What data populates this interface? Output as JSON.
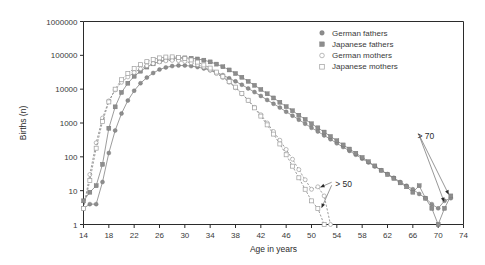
{
  "chart_data": {
    "type": "line",
    "title": "",
    "xlabel": "Age in years",
    "ylabel": "Births (n)",
    "yscale": "log",
    "ylim": [
      1,
      1000000
    ],
    "xlim": [
      14,
      74
    ],
    "xticks": [
      14,
      18,
      22,
      26,
      30,
      34,
      38,
      42,
      46,
      50,
      54,
      58,
      62,
      66,
      70,
      74
    ],
    "xticklabels": [
      "14",
      "18",
      "22",
      "26",
      "30",
      "34",
      "38",
      "42",
      "46",
      "50",
      "54",
      "58",
      "62",
      "66",
      "70",
      "74"
    ],
    "yticks": [
      1,
      10,
      100,
      1000,
      10000,
      100000,
      1000000
    ],
    "yticklabels": [
      "1",
      "10",
      "100",
      "1000",
      "10000",
      "100000",
      "1000000"
    ],
    "grid": false,
    "legend_position": "top-right",
    "annotations": [
      {
        "text": "> 50",
        "x": 53.5,
        "y": 16
      },
      {
        "text": "> 70",
        "x": 66.5,
        "y": 420
      }
    ],
    "series": [
      {
        "name": "German fathers",
        "marker": "filled-circle",
        "linestyle": "solid",
        "color": "#8d8d8d",
        "x": [
          14,
          15,
          16,
          17,
          18,
          19,
          20,
          21,
          22,
          23,
          24,
          25,
          26,
          27,
          28,
          29,
          30,
          31,
          32,
          33,
          34,
          35,
          36,
          37,
          38,
          39,
          40,
          41,
          42,
          43,
          44,
          45,
          46,
          47,
          48,
          49,
          50,
          51,
          52,
          53,
          54,
          55,
          56,
          57,
          58,
          59,
          60,
          61,
          62,
          63,
          64,
          65,
          66,
          67,
          68,
          69,
          70,
          71,
          72
        ],
        "y": [
          3,
          4,
          4,
          18,
          130,
          600,
          1900,
          4600,
          9000,
          15000,
          22000,
          30000,
          38000,
          44000,
          48000,
          50000,
          50000,
          48000,
          45000,
          41000,
          36000,
          31000,
          26000,
          21000,
          17000,
          13500,
          10500,
          8200,
          6300,
          4800,
          3700,
          2850,
          2150,
          1650,
          1250,
          950,
          720,
          560,
          430,
          330,
          250,
          195,
          150,
          115,
          88,
          68,
          52,
          40,
          31,
          24,
          18,
          14,
          11,
          8,
          6,
          4,
          3,
          5,
          6
        ]
      },
      {
        "name": "Japanese fathers",
        "marker": "filled-square",
        "linestyle": "solid",
        "color": "#8d8d8d",
        "x": [
          14,
          15,
          16,
          17,
          18,
          19,
          20,
          21,
          22,
          23,
          24,
          25,
          26,
          27,
          28,
          29,
          30,
          31,
          32,
          33,
          34,
          35,
          36,
          37,
          38,
          39,
          40,
          41,
          42,
          43,
          44,
          45,
          46,
          47,
          48,
          49,
          50,
          51,
          52,
          53,
          54,
          55,
          56,
          57,
          58,
          59,
          60,
          61,
          62,
          63,
          64,
          65,
          66,
          67,
          68,
          69,
          70,
          71,
          72
        ],
        "y": [
          5,
          9,
          14,
          60,
          700,
          3000,
          8000,
          15000,
          24000,
          34000,
          45000,
          56000,
          66000,
          74000,
          80000,
          83000,
          84000,
          82000,
          78000,
          72000,
          64000,
          55000,
          46000,
          37000,
          29000,
          22500,
          17000,
          13000,
          9800,
          7300,
          5500,
          4100,
          3050,
          2300,
          1700,
          1280,
          950,
          720,
          540,
          400,
          300,
          225,
          170,
          128,
          96,
          72,
          54,
          40,
          30,
          23,
          17,
          13,
          9,
          14,
          6,
          3,
          1,
          3,
          7
        ]
      },
      {
        "name": "German mothers",
        "marker": "open-circle",
        "linestyle": "dashed",
        "color": "#a6a6a6",
        "x": [
          14,
          15,
          16,
          17,
          18,
          19,
          20,
          21,
          22,
          23,
          24,
          25,
          26,
          27,
          28,
          29,
          30,
          31,
          32,
          33,
          34,
          35,
          36,
          37,
          38,
          39,
          40,
          41,
          42,
          43,
          44,
          45,
          46,
          47,
          48,
          49,
          50,
          51,
          52,
          53
        ],
        "y": [
          3,
          30,
          260,
          1400,
          4500,
          9500,
          16000,
          23000,
          31000,
          40000,
          49000,
          57000,
          64000,
          69000,
          71000,
          70000,
          66000,
          60000,
          53000,
          45000,
          37000,
          29000,
          22000,
          16000,
          11000,
          7300,
          4700,
          2900,
          1750,
          1000,
          560,
          310,
          165,
          85,
          42,
          21,
          11,
          13,
          7,
          1
        ]
      },
      {
        "name": "Japanese mothers",
        "marker": "open-square",
        "linestyle": "dashed",
        "color": "#a6a6a6",
        "x": [
          14,
          15,
          16,
          17,
          18,
          19,
          20,
          21,
          22,
          23,
          24,
          25,
          26,
          27,
          28,
          29,
          30,
          31,
          32,
          33,
          34,
          35,
          36,
          37,
          38,
          39,
          40,
          41,
          42,
          43,
          44,
          45,
          46,
          47,
          48,
          49,
          50,
          51,
          52
        ],
        "y": [
          3,
          20,
          180,
          1100,
          4200,
          10000,
          19000,
          29000,
          41000,
          53000,
          65000,
          76000,
          84000,
          89000,
          90000,
          87000,
          81000,
          73000,
          63000,
          52000,
          42000,
          32000,
          24000,
          17000,
          11500,
          7500,
          4700,
          2800,
          1600,
          880,
          470,
          240,
          115,
          53,
          24,
          11,
          5,
          3,
          1
        ]
      }
    ]
  },
  "legend": {
    "items": [
      {
        "label": "German fathers",
        "marker": "filled-circle"
      },
      {
        "label": "Japanese fathers",
        "marker": "filled-square"
      },
      {
        "label": "German mothers",
        "marker": "open-circle"
      },
      {
        "label": "Japanese mothers",
        "marker": "open-square"
      }
    ]
  }
}
